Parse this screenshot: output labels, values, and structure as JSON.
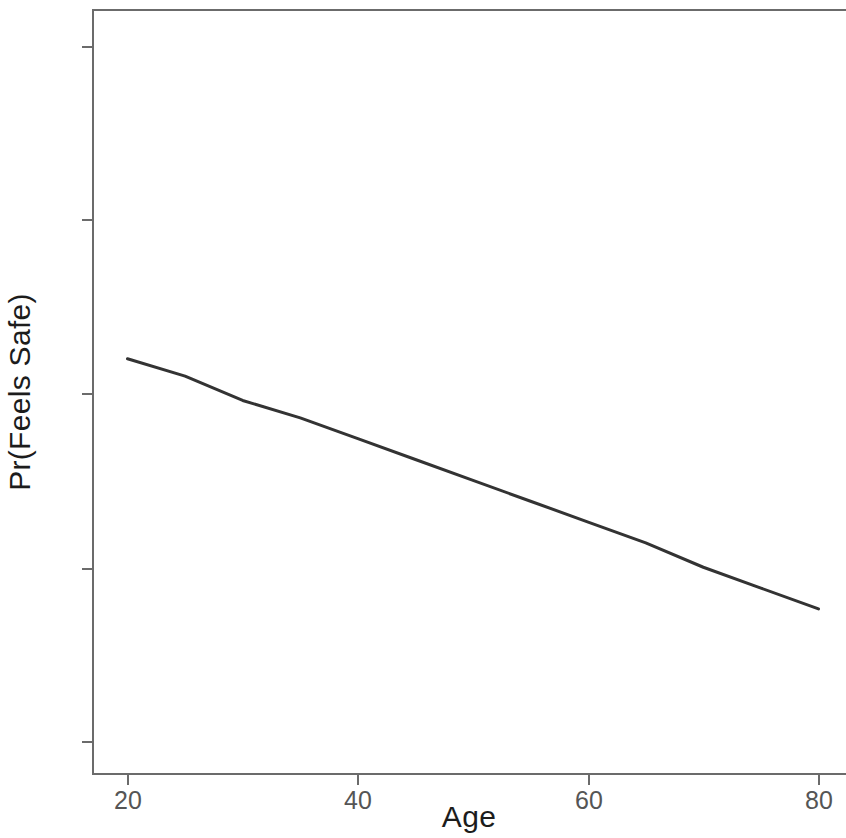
{
  "chart_data": {
    "type": "line",
    "title": "",
    "subtitle": "",
    "xlabel": "Age",
    "ylabel": "Pr(Feels Safe)",
    "xlim": [
      17,
      82
    ],
    "ylim": [
      0.69,
      0.915
    ],
    "xticks": [
      20,
      40,
      60,
      80
    ],
    "xtick_labels": [
      "20",
      "40",
      "60",
      "80"
    ],
    "yticks": [
      0.7,
      0.75,
      0.8,
      0.85,
      0.9
    ],
    "ytick_labels": [
      "0.70",
      "0.75",
      "0.80",
      "0.85",
      "0.90"
    ],
    "grid": false,
    "legend": null,
    "series": [
      {
        "name": "Pr(Feels Safe)",
        "color": "#333333",
        "line_width": 3,
        "x": [
          20,
          25,
          30,
          35,
          40,
          45,
          50,
          55,
          60,
          65,
          70,
          75,
          80
        ],
        "values": [
          0.81,
          0.805,
          0.798,
          0.793,
          0.787,
          0.781,
          0.775,
          0.769,
          0.763,
          0.757,
          0.75,
          0.744,
          0.738
        ]
      }
    ],
    "annotations": []
  },
  "axes": {
    "y_title": "Pr(Feels Safe)",
    "x_title": "Age",
    "tick_color": "#555555",
    "axis_line_color": "#6b6b6b",
    "panel_background": "#ffffff"
  }
}
